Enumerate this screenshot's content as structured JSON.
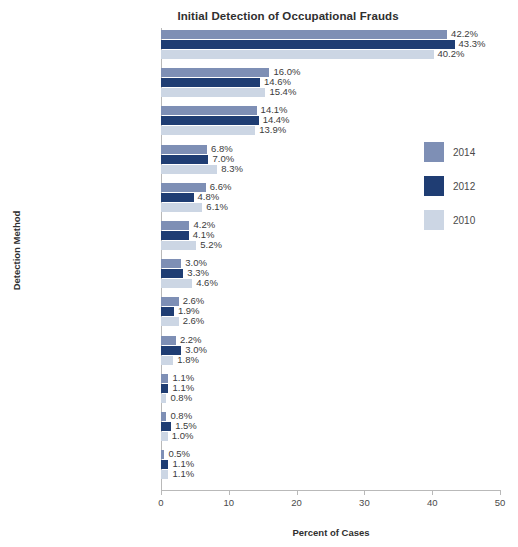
{
  "chart_data": {
    "type": "bar",
    "orientation": "horizontal",
    "title": "Initial Detection of Occupational Frauds",
    "xlabel": "Percent of Cases",
    "ylabel": "Detection Method",
    "xlim": [
      0,
      50
    ],
    "xticks": [
      0,
      10,
      20,
      30,
      40,
      50
    ],
    "grid": false,
    "legend_position": "right",
    "categories": [
      "Tip",
      "Management Review",
      "Internal Audit",
      "By Accident",
      "Account Reconciliation",
      "Document Examination",
      "External Audit",
      "Surveillance/Monitoring",
      "Notified by Law Enforcement",
      "IT Controls",
      "Confession",
      "Other*"
    ],
    "series": [
      {
        "name": "2014",
        "color": "#7e8fb5",
        "values": [
          42.2,
          16.0,
          14.1,
          6.8,
          6.6,
          4.2,
          3.0,
          2.6,
          2.2,
          1.1,
          0.8,
          0.5
        ],
        "labels": [
          "42.2%",
          "16.0%",
          "14.1%",
          "6.8%",
          "6.6%",
          "4.2%",
          "3.0%",
          "2.6%",
          "2.2%",
          "1.1%",
          "0.8%",
          "0.5%"
        ]
      },
      {
        "name": "2012",
        "color": "#1f3d73",
        "values": [
          43.3,
          14.6,
          14.4,
          7.0,
          4.8,
          4.1,
          3.3,
          1.9,
          3.0,
          1.1,
          1.5,
          1.1
        ],
        "labels": [
          "43.3%",
          "14.6%",
          "14.4%",
          "7.0%",
          "4.8%",
          "4.1%",
          "3.3%",
          "1.9%",
          "3.0%",
          "1.1%",
          "1.5%",
          "1.1%"
        ]
      },
      {
        "name": "2010",
        "color": "#ccd6e4",
        "values": [
          40.2,
          15.4,
          13.9,
          8.3,
          6.1,
          5.2,
          4.6,
          2.6,
          1.8,
          0.8,
          1.0,
          1.1
        ],
        "labels": [
          "40.2%",
          "15.4%",
          "13.9%",
          "8.3%",
          "6.1%",
          "5.2%",
          "4.6%",
          "2.6%",
          "1.8%",
          "0.8%",
          "1.0%",
          "1.1%"
        ]
      }
    ]
  },
  "legend": {
    "items": [
      {
        "label": "2014",
        "color": "#7e8fb5"
      },
      {
        "label": "2012",
        "color": "#1f3d73"
      },
      {
        "label": "2010",
        "color": "#ccd6e4"
      }
    ]
  }
}
